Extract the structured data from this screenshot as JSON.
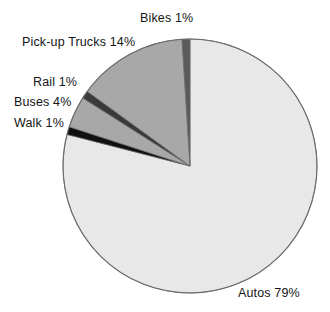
{
  "chart_data": {
    "type": "pie",
    "title": "",
    "xlabel": "",
    "ylabel": "",
    "categories": [
      "Autos",
      "Walk",
      "Buses",
      "Rail",
      "Pick-up Trucks",
      "Bikes"
    ],
    "values": [
      79,
      1,
      4,
      1,
      14,
      1
    ],
    "unit": "%",
    "legend_position": "none",
    "labels_inline": true,
    "grid": false,
    "slices": [
      {
        "name": "Autos",
        "value": 79,
        "label": "Autos 79%",
        "color": "#e8e8e8"
      },
      {
        "name": "Walk",
        "value": 1,
        "label": "Walk 1%",
        "color": "#101010"
      },
      {
        "name": "Buses",
        "value": 4,
        "label": "Buses 4%",
        "color": "#a8a8a8"
      },
      {
        "name": "Rail",
        "value": 1,
        "label": "Rail 1%",
        "color": "#3a3a3a"
      },
      {
        "name": "Pick-up Trucks",
        "value": 14,
        "label": "Pick-up Trucks 14%",
        "color": "#a8a8a8"
      },
      {
        "name": "Bikes",
        "value": 1,
        "label": "Bikes 1%",
        "color": "#5a5a5a"
      }
    ],
    "geometry": {
      "center_x": 190,
      "center_y": 166,
      "radius": 127,
      "start_angle_deg": 0,
      "direction": "clockwise"
    },
    "style": {
      "background": "#ffffff",
      "outline_color": "#6b6b6b",
      "label_color": "#141414"
    }
  }
}
